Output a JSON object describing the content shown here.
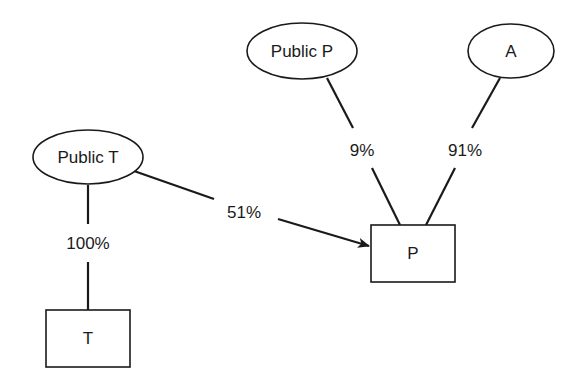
{
  "diagram": {
    "type": "ownership-structure",
    "nodes": [
      {
        "id": "public_t",
        "label": "Public T",
        "shape": "ellipse"
      },
      {
        "id": "t",
        "label": "T",
        "shape": "box"
      },
      {
        "id": "public_p",
        "label": "Public P",
        "shape": "ellipse"
      },
      {
        "id": "a",
        "label": "A",
        "shape": "ellipse"
      },
      {
        "id": "p",
        "label": "P",
        "shape": "box"
      }
    ],
    "edges": [
      {
        "from": "public_t",
        "to": "t",
        "label": "100%",
        "arrow": false
      },
      {
        "from": "public_t",
        "to": "p",
        "label": "51%",
        "arrow": true
      },
      {
        "from": "public_p",
        "to": "p",
        "label": "9%",
        "arrow": false
      },
      {
        "from": "a",
        "to": "p",
        "label": "91%",
        "arrow": false
      }
    ]
  }
}
